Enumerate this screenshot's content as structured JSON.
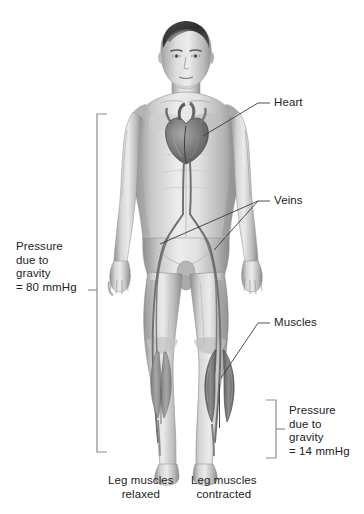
{
  "figure": {
    "title_present": false,
    "background_color": "#ffffff",
    "ink_color": "#232323",
    "leader_color": "#3a3a3a"
  },
  "callouts": [
    {
      "id": "heart",
      "label": "Heart",
      "x": 274,
      "y": 96
    },
    {
      "id": "veins",
      "label": "Veins",
      "x": 274,
      "y": 194
    },
    {
      "id": "muscles",
      "label": "Muscles",
      "x": 274,
      "y": 316
    }
  ],
  "brackets": [
    {
      "id": "left-bracket",
      "label": "Pressure\ndue to\ngravity\n= 80 mmHg",
      "value": "= 80 mmHg",
      "pressure_mmHg": 80,
      "text_x": 16,
      "text_y": 240,
      "top": 114,
      "bottom": 452,
      "tick": 290
    },
    {
      "id": "right-bracket",
      "label": "Pressure\ndue to\ngravity\n= 14 mmHg",
      "value": "= 14 mmHg",
      "pressure_mmHg": 14,
      "text_x": 289,
      "text_y": 404,
      "top": 400,
      "bottom": 458,
      "tick": 429
    }
  ],
  "captions": [
    {
      "id": "caption-relaxed",
      "label": "Leg muscles\nrelaxed",
      "x": 108,
      "y": 474
    },
    {
      "id": "caption-contracted",
      "label": "Leg muscles\ncontracted",
      "x": 191,
      "y": 474
    }
  ],
  "anatomy": {
    "subject": "standing male figure, anterior view",
    "structures": [
      "heart",
      "veins of the legs",
      "calf muscles relaxed (left leg)",
      "calf muscles contracted (right leg)"
    ]
  }
}
